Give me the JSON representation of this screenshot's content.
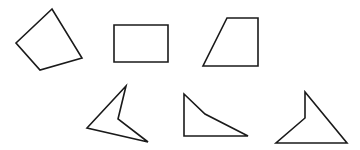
{
  "figure": {
    "background": "#ffffff",
    "stroke_color": "#1a1a1a",
    "shapes": [
      {
        "name": "quadrilateral-irregular",
        "kind": "quadrilateral",
        "points": "52,9 16,43 40,70 82,58"
      },
      {
        "name": "rectangle",
        "kind": "rectangle",
        "points": "114,25 168,25 168,62 114,62"
      },
      {
        "name": "trapezoid",
        "kind": "right trapezoid",
        "points": "227,18 258,18 258,66 203,66"
      },
      {
        "name": "concave-quadrilateral-arrowhead",
        "kind": "concave quadrilateral",
        "points": "126,86 118,119 148,142 87,128"
      },
      {
        "name": "concave-quadrilateral-right",
        "kind": "concave quadrilateral",
        "points": "184,94 205,114 248,136 184,136"
      },
      {
        "name": "concave-quadrilateral-notched",
        "kind": "concave quadrilateral",
        "points": "305,92 305,118 276,143 347,143"
      }
    ]
  }
}
